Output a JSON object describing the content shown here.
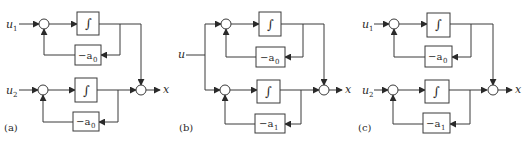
{
  "figure": {
    "panels": [
      {
        "id": "a",
        "caption": "(a)",
        "inputs": [
          {
            "name": "u",
            "sub": "1"
          },
          {
            "name": "u",
            "sub": "2"
          }
        ],
        "integrator_symbol": "∫",
        "feedback_top": {
          "prefix": "−a",
          "sub": "0"
        },
        "feedback_bottom": {
          "prefix": "−a",
          "sub": "0"
        },
        "output": "x"
      },
      {
        "id": "b",
        "caption": "(b)",
        "inputs": [
          {
            "name": "u",
            "sub": ""
          }
        ],
        "integrator_symbol": "∫",
        "feedback_top": {
          "prefix": "−a",
          "sub": "0"
        },
        "feedback_bottom": {
          "prefix": "−a",
          "sub": "1"
        },
        "output": "x"
      },
      {
        "id": "c",
        "caption": "(c)",
        "inputs": [
          {
            "name": "u",
            "sub": "1"
          },
          {
            "name": "u",
            "sub": "2"
          }
        ],
        "integrator_symbol": "∫",
        "feedback_top": {
          "prefix": "−a",
          "sub": "0"
        },
        "feedback_bottom": {
          "prefix": "−a",
          "sub": "1"
        },
        "output": "x"
      }
    ],
    "colors": {
      "stroke": "#3a3a3a",
      "text": "#2a2a2a",
      "background": "#ffffff"
    }
  }
}
